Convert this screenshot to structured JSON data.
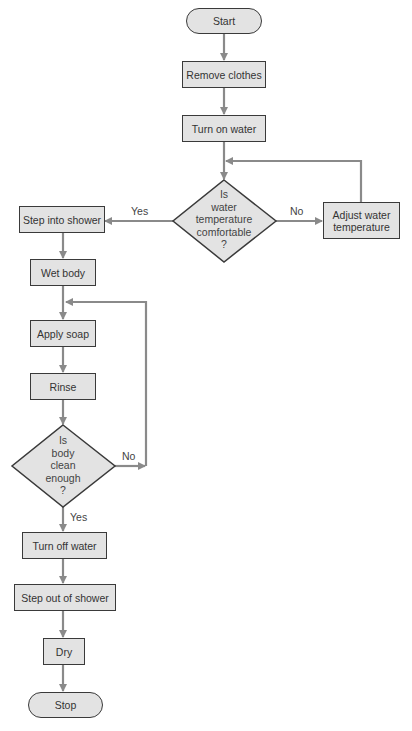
{
  "diagram": {
    "type": "flowchart",
    "colors": {
      "node_fill": "#e3e3e3",
      "node_border": "#3a3a3a",
      "connector": "#8a8a8a",
      "text": "#333333"
    },
    "nodes": {
      "start": "Start",
      "remove_clothes": "Remove clothes",
      "turn_on_water": "Turn on water",
      "decision_temp": [
        "Is",
        "water",
        "temperature",
        "comfortable",
        "?"
      ],
      "adjust_water": [
        "Adjust water",
        "temperature"
      ],
      "step_into_shower": "Step into shower",
      "wet_body": "Wet body",
      "apply_soap": "Apply soap",
      "rinse": "Rinse",
      "decision_clean": [
        "Is",
        "body",
        "clean",
        "enough",
        "?"
      ],
      "turn_off_water": "Turn off water",
      "step_out": "Step out of shower",
      "dry": "Dry",
      "stop": "Stop"
    },
    "edge_labels": {
      "temp_yes": "Yes",
      "temp_no": "No",
      "clean_no": "No",
      "clean_yes": "Yes"
    }
  }
}
